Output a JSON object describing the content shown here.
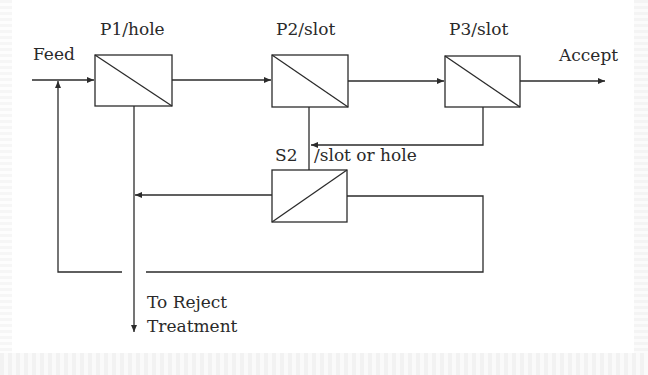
{
  "diagram": {
    "labels": {
      "feed": "Feed",
      "p1": "P1/hole",
      "p2": "P2/slot",
      "p3": "P3/slot",
      "accept": "Accept",
      "s2": "S2",
      "s2_type": "/slot or hole",
      "reject_line1": "To Reject",
      "reject_line2": "Treatment"
    },
    "nodes": [
      {
        "id": "P1",
        "label": "P1/hole",
        "type": "screen"
      },
      {
        "id": "P2",
        "label": "P2/slot",
        "type": "screen"
      },
      {
        "id": "P3",
        "label": "P3/slot",
        "type": "screen"
      },
      {
        "id": "S2",
        "label": "S2 /slot or hole",
        "type": "screen"
      }
    ],
    "edges": [
      {
        "from": "Feed",
        "to": "P1"
      },
      {
        "from": "P1",
        "to": "P2",
        "stream": "accept"
      },
      {
        "from": "P2",
        "to": "P3",
        "stream": "accept"
      },
      {
        "from": "P3",
        "to": "Accept",
        "stream": "accept"
      },
      {
        "from": "P2",
        "to": "S2",
        "stream": "reject"
      },
      {
        "from": "P3",
        "to": "S2",
        "stream": "reject"
      },
      {
        "from": "S2",
        "to": "P1-reject-line",
        "stream": "reject"
      },
      {
        "from": "S2",
        "to": "Feed",
        "stream": "accept (recycle)"
      },
      {
        "from": "P1",
        "to": "To Reject Treatment",
        "stream": "reject"
      }
    ],
    "colors": {
      "line": "#2b2b2b",
      "background": "#ffffff"
    }
  }
}
